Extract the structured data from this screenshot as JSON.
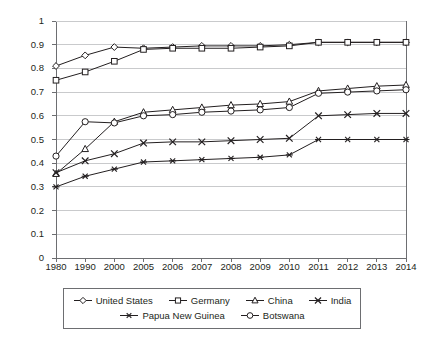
{
  "chart_data": {
    "type": "line",
    "title": "",
    "xlabel": "",
    "ylabel": "",
    "ylim": [
      0,
      1
    ],
    "ytick_step": 0.1,
    "grid": "horizontal",
    "legend_position": "bottom",
    "categories": [
      "1980",
      "1990",
      "2000",
      "2005",
      "2006",
      "2007",
      "2008",
      "2009",
      "2010",
      "2011",
      "2012",
      "2013",
      "2014"
    ],
    "ytick_labels": [
      "0",
      "0.1",
      "0.2",
      "0.3",
      "0.4",
      "0.5",
      "0.6",
      "0.7",
      "0.8",
      "0.9",
      "1"
    ],
    "ytick_values": [
      0,
      0.1,
      0.2,
      0.3,
      0.4,
      0.5,
      0.6,
      0.7,
      0.8,
      0.9,
      1
    ],
    "series": [
      {
        "name": "United States",
        "marker": "diamond",
        "color": "#231f20",
        "values": [
          0.81,
          0.855,
          0.89,
          0.885,
          0.89,
          0.895,
          0.895,
          0.895,
          0.9,
          0.91,
          0.91,
          0.91,
          0.91
        ]
      },
      {
        "name": "Germany",
        "marker": "square",
        "color": "#231f20",
        "values": [
          0.75,
          0.785,
          0.83,
          0.88,
          0.885,
          0.885,
          0.885,
          0.89,
          0.895,
          0.91,
          0.91,
          0.91,
          0.91
        ]
      },
      {
        "name": "China",
        "marker": "triangle",
        "color": "#231f20",
        "values": [
          0.355,
          0.46,
          0.575,
          0.615,
          0.625,
          0.635,
          0.645,
          0.65,
          0.66,
          0.705,
          0.715,
          0.725,
          0.73
        ]
      },
      {
        "name": "India",
        "marker": "cross",
        "color": "#231f20",
        "values": [
          0.36,
          0.41,
          0.44,
          0.485,
          0.49,
          0.49,
          0.495,
          0.5,
          0.505,
          0.6,
          0.605,
          0.61,
          0.61
        ]
      },
      {
        "name": "Papua New Guinea",
        "marker": "asterisk",
        "color": "#231f20",
        "values": [
          0.3,
          0.345,
          0.375,
          0.405,
          0.41,
          0.415,
          0.42,
          0.425,
          0.435,
          0.5,
          0.5,
          0.5,
          0.5
        ]
      },
      {
        "name": "Botswana",
        "marker": "circle",
        "color": "#231f20",
        "values": [
          0.43,
          0.575,
          0.57,
          0.6,
          0.605,
          0.615,
          0.62,
          0.625,
          0.635,
          0.695,
          0.7,
          0.705,
          0.71
        ]
      }
    ]
  },
  "legend": {
    "row1": [
      "United States",
      "Germany",
      "China",
      "India"
    ],
    "row2": [
      "Papua New Guinea",
      "Botswana"
    ]
  }
}
